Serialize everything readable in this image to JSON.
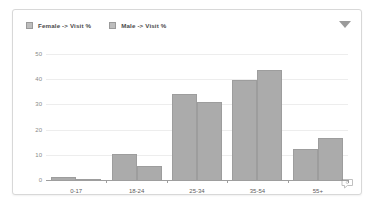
{
  "widget": {
    "dropdown_icon": "chevron-down-icon",
    "comment_icon": "comment-bubble-icon"
  },
  "chart_data": {
    "type": "bar",
    "title": "",
    "xlabel": "",
    "ylabel": "",
    "categories": [
      "0-17",
      "18-24",
      "25-34",
      "35-54",
      "55+"
    ],
    "series": [
      {
        "name": "Female -> Visit %",
        "color": "#ababab",
        "values": [
          1,
          10.5,
          34,
          39.5,
          12.5
        ]
      },
      {
        "name": "Male -> Visit %",
        "color": "#ababab",
        "values": [
          0.3,
          5.5,
          31,
          43.5,
          16.5
        ]
      }
    ],
    "ylim": [
      0,
      50
    ],
    "yticks": [
      0,
      10,
      20,
      30,
      40,
      50
    ],
    "ytick_labels": [
      "0",
      "10",
      "20",
      "30",
      "40",
      "50"
    ],
    "grid": true,
    "legend_position": "top-left"
  }
}
